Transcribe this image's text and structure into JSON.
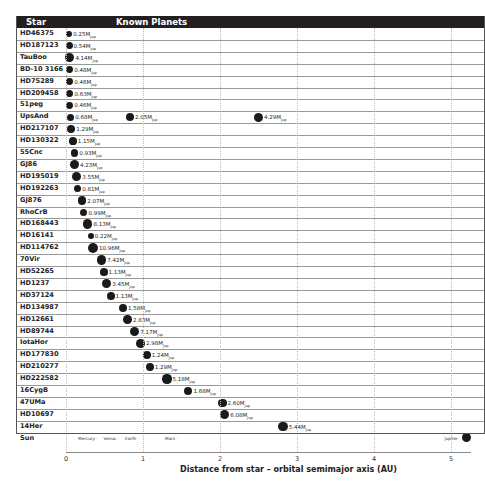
{
  "chart_data": {
    "type": "scatter",
    "title": "Known Planets",
    "column_header_star": "Star",
    "column_header_planets": "Known Planets",
    "xlabel": "Distance from star – orbital semimajor axis (AU)",
    "xlim": [
      0,
      5.3
    ],
    "xticks": [
      0,
      1,
      2,
      3,
      4,
      5
    ],
    "grid": true,
    "mass_unit": "MJup",
    "stars": [
      {
        "star": "HD46375",
        "planets": [
          {
            "a": 0.04,
            "mass": "0.25"
          }
        ]
      },
      {
        "star": "HD187123",
        "planets": [
          {
            "a": 0.04,
            "mass": "0.54"
          }
        ]
      },
      {
        "star": "TauBoo",
        "planets": [
          {
            "a": 0.05,
            "mass": "4.14"
          }
        ]
      },
      {
        "star": "BD-10 3166",
        "planets": [
          {
            "a": 0.05,
            "mass": "0.48"
          }
        ]
      },
      {
        "star": "HD75289",
        "planets": [
          {
            "a": 0.05,
            "mass": "0.46"
          }
        ]
      },
      {
        "star": "HD209458",
        "planets": [
          {
            "a": 0.05,
            "mass": "0.63"
          }
        ]
      },
      {
        "star": "51peg",
        "planets": [
          {
            "a": 0.05,
            "mass": "0.46"
          }
        ]
      },
      {
        "star": "UpsAnd",
        "planets": [
          {
            "a": 0.06,
            "mass": "0.68"
          },
          {
            "a": 0.83,
            "mass": "2.05"
          },
          {
            "a": 2.5,
            "mass": "4.29"
          }
        ]
      },
      {
        "star": "HD217107",
        "planets": [
          {
            "a": 0.07,
            "mass": "1.29"
          }
        ]
      },
      {
        "star": "HD130322",
        "planets": [
          {
            "a": 0.09,
            "mass": "1.15"
          }
        ]
      },
      {
        "star": "55Cnc",
        "planets": [
          {
            "a": 0.11,
            "mass": "0.93"
          }
        ]
      },
      {
        "star": "GJ86",
        "planets": [
          {
            "a": 0.11,
            "mass": "4.23"
          }
        ]
      },
      {
        "star": "HD195019",
        "planets": [
          {
            "a": 0.14,
            "mass": "3.55"
          }
        ]
      },
      {
        "star": "HD192263",
        "planets": [
          {
            "a": 0.15,
            "mass": "0.81"
          }
        ]
      },
      {
        "star": "GJ876",
        "planets": [
          {
            "a": 0.21,
            "mass": "2.07"
          }
        ]
      },
      {
        "star": "RhoCrB",
        "planets": [
          {
            "a": 0.23,
            "mass": "0.99"
          }
        ]
      },
      {
        "star": "HD168443",
        "planets": [
          {
            "a": 0.28,
            "mass": "8.13"
          }
        ]
      },
      {
        "star": "HD16141",
        "planets": [
          {
            "a": 0.32,
            "mass": "0.22"
          }
        ]
      },
      {
        "star": "HD114762",
        "planets": [
          {
            "a": 0.35,
            "mass": "10.96"
          }
        ]
      },
      {
        "star": "70Vir",
        "planets": [
          {
            "a": 0.46,
            "mass": "7.42"
          }
        ]
      },
      {
        "star": "HD52265",
        "planets": [
          {
            "a": 0.49,
            "mass": "1.13"
          }
        ]
      },
      {
        "star": "HD1237",
        "planets": [
          {
            "a": 0.53,
            "mass": "3.45"
          }
        ]
      },
      {
        "star": "HD37124",
        "planets": [
          {
            "a": 0.58,
            "mass": "1.13"
          }
        ]
      },
      {
        "star": "HD134987",
        "planets": [
          {
            "a": 0.74,
            "mass": "1.58"
          }
        ]
      },
      {
        "star": "HD12661",
        "planets": [
          {
            "a": 0.8,
            "mass": "2.83"
          }
        ]
      },
      {
        "star": "HD89744",
        "planets": [
          {
            "a": 0.89,
            "mass": "7.17"
          }
        ]
      },
      {
        "star": "IotaHor",
        "planets": [
          {
            "a": 0.97,
            "mass": "2.98"
          }
        ]
      },
      {
        "star": "HD177830",
        "planets": [
          {
            "a": 1.05,
            "mass": "1.24"
          }
        ]
      },
      {
        "star": "HD210277",
        "planets": [
          {
            "a": 1.09,
            "mass": "1.29"
          }
        ]
      },
      {
        "star": "HD222582",
        "planets": [
          {
            "a": 1.31,
            "mass": "5.18"
          }
        ]
      },
      {
        "star": "16CygB",
        "planets": [
          {
            "a": 1.59,
            "mass": "1.68"
          }
        ]
      },
      {
        "star": "47UMa",
        "planets": [
          {
            "a": 2.03,
            "mass": "2.60"
          }
        ]
      },
      {
        "star": "HD10697",
        "planets": [
          {
            "a": 2.06,
            "mass": "6.08"
          }
        ]
      },
      {
        "star": "14Her",
        "planets": [
          {
            "a": 2.82,
            "mass": "5.44"
          }
        ]
      }
    ],
    "sun": {
      "label": "Sun",
      "planets": [
        {
          "name": "Mercury",
          "a": 0.39
        },
        {
          "name": "Venus",
          "a": 0.72
        },
        {
          "name": "Earth",
          "a": 1.0
        },
        {
          "name": "Mars",
          "a": 1.52
        },
        {
          "name": "Jupiter",
          "a": 5.2
        }
      ]
    }
  }
}
